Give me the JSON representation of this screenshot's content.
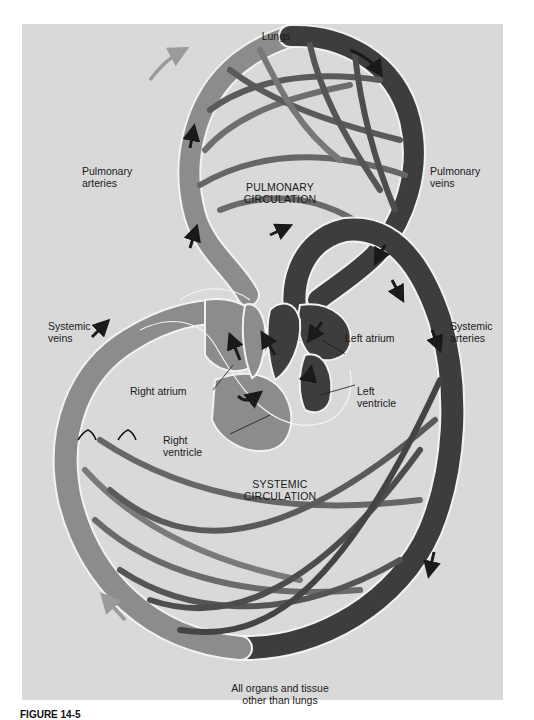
{
  "figure": {
    "colors": {
      "background": "#d9d9d9",
      "deoxygenated": "#8c8c8c",
      "oxygenated": "#3d3d3d",
      "outline": "#f2f2f2",
      "arrow_light": "#9a9a9a",
      "arrow_dark": "#1a1a1a"
    },
    "labels": {
      "lungs": "Lungs",
      "pulmonary_arteries_1": "Pulmonary",
      "pulmonary_arteries_2": "arteries",
      "pulmonary_veins_1": "Pulmonary",
      "pulmonary_veins_2": "veins",
      "pulmonary_circulation_1": "PULMONARY",
      "pulmonary_circulation_2": "CIRCULATION",
      "systemic_veins_1": "Systemic",
      "systemic_veins_2": "veins",
      "systemic_arteries_1": "Systemic",
      "systemic_arteries_2": "arteries",
      "left_atrium": "Left atrium",
      "left_ventricle_1": "Left",
      "left_ventricle_2": "ventricle",
      "right_atrium": "Right atrium",
      "right_ventricle_1": "Right",
      "right_ventricle_2": "ventricle",
      "systemic_circulation_1": "SYSTEMIC",
      "systemic_circulation_2": "CIRCULATION",
      "organs_1": "All organs and tissue",
      "organs_2": "other than lungs"
    },
    "caption": "FIGURE 14-5"
  }
}
